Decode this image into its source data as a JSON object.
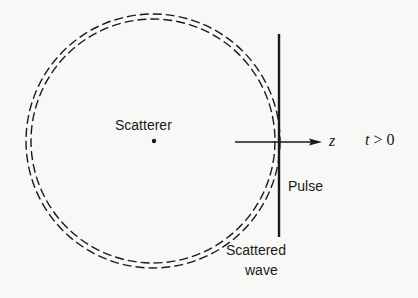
{
  "diagram": {
    "labels": {
      "scatterer": "Scatterer",
      "axis": "z",
      "time_condition_var": "t",
      "time_condition_rest": " > 0",
      "pulse": "Pulse",
      "scattered_line1": "Scattered",
      "scattered_line2": "wave"
    },
    "colors": {
      "ink": "#1a1a1a",
      "background": "#f8f8f6"
    }
  }
}
